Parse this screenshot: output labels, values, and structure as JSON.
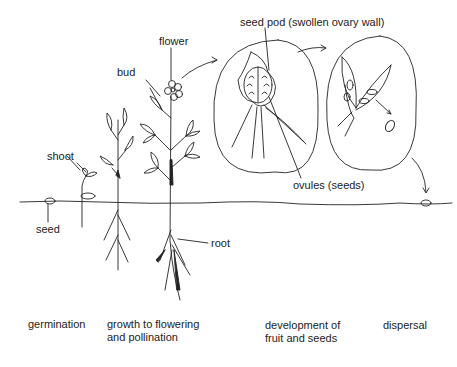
{
  "labels": {
    "flower": "flower",
    "bud": "bud",
    "shoot": "shoot",
    "seed": "seed",
    "root": "root",
    "seed_pod": "seed pod (swollen ovary wall)",
    "ovules": "ovules (seeds)"
  },
  "stages": [
    {
      "label": "germination"
    },
    {
      "label": "growth to flowering\nand pollination"
    },
    {
      "label": "development of\nfruit and seeds"
    },
    {
      "label": "dispersal"
    }
  ],
  "colors": {
    "line": "#222222",
    "background": "#ffffff"
  }
}
